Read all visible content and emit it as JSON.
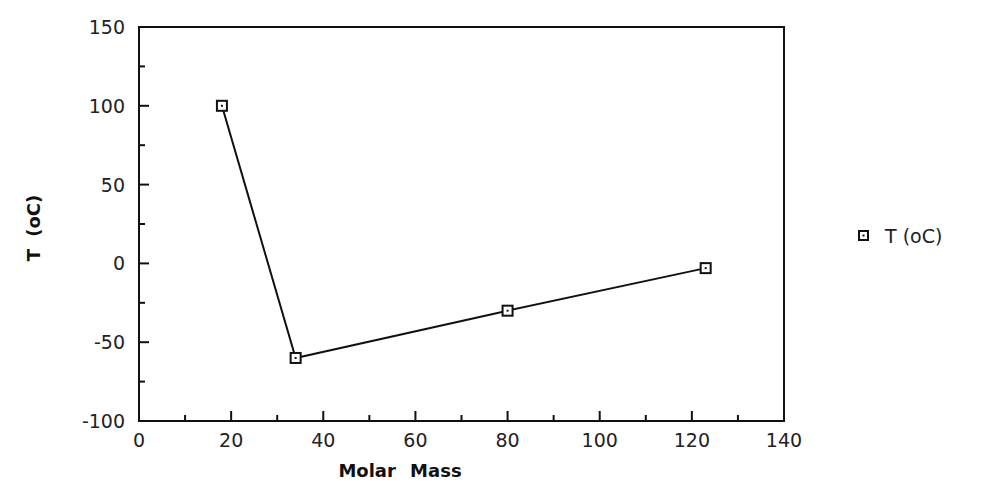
{
  "chart_data": {
    "type": "line",
    "title": "",
    "xlabel": "Molar Mass",
    "ylabel": "T (oC)",
    "xlim": [
      0,
      140
    ],
    "ylim": [
      -100,
      150
    ],
    "xticks": [
      0,
      20,
      40,
      60,
      80,
      100,
      120,
      140
    ],
    "yticks": [
      -100,
      -50,
      0,
      50,
      100,
      150
    ],
    "x_minor_step": 10,
    "y_minor_step": 25,
    "grid": false,
    "legend_position": "right",
    "series": [
      {
        "name": "T (oC)",
        "marker": "square",
        "color": "#111111",
        "x": [
          18,
          34,
          80,
          123
        ],
        "y": [
          100,
          -60,
          -30,
          -3
        ]
      }
    ]
  },
  "legend": {
    "items": [
      {
        "label": "T (oC)",
        "marker": "square"
      }
    ]
  }
}
